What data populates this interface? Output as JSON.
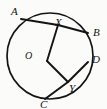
{
  "figure": {
    "kind": "circle-geometry-diagram",
    "canvas": {
      "width": 107,
      "height": 109
    },
    "background_color": "#fbfbf9",
    "stroke_color": "#141414",
    "circle": {
      "cx": 50,
      "cy": 56,
      "r": 43,
      "stroke_width": 1.6
    },
    "points": [
      {
        "id": "A",
        "label": "A",
        "x": 21,
        "y": 19,
        "label_x": 11,
        "label_y": 6,
        "on_circle": true
      },
      {
        "id": "X",
        "label": "X",
        "x": 58,
        "y": 25,
        "label_x": 55,
        "label_y": 17,
        "on_circle": false
      },
      {
        "id": "B",
        "label": "B",
        "x": 88,
        "y": 33,
        "label_x": 93,
        "label_y": 27,
        "on_circle": true
      },
      {
        "id": "O",
        "label": "O",
        "x": 47,
        "y": 61,
        "label_x": 25,
        "label_y": 51,
        "on_circle": false
      },
      {
        "id": "D",
        "label": "D",
        "x": 88,
        "y": 62,
        "label_x": 92,
        "label_y": 54,
        "on_circle": true
      },
      {
        "id": "Y",
        "label": "Y",
        "x": 68,
        "y": 82,
        "label_x": 69,
        "label_y": 83,
        "on_circle": false
      },
      {
        "id": "C",
        "label": "C",
        "x": 45,
        "y": 99,
        "label_x": 40,
        "label_y": 99,
        "on_circle": true
      }
    ],
    "segments": [
      {
        "id": "A-B",
        "from": "A",
        "to": "B",
        "through": "X",
        "label": "chord-a-b"
      },
      {
        "id": "X-O",
        "from": "X",
        "to": "O",
        "label": "segment-x-o"
      },
      {
        "id": "O-Y",
        "from": "O",
        "to": "Y",
        "label": "segment-o-y"
      },
      {
        "id": "C-D",
        "from": "C",
        "to": "D",
        "through": "Y",
        "label": "chord-c-d"
      }
    ]
  }
}
